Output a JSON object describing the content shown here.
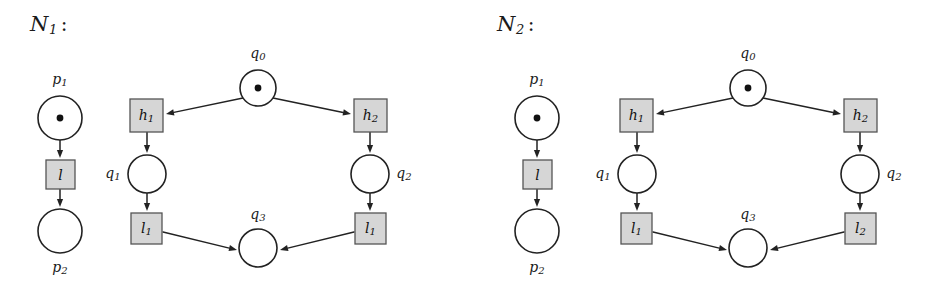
{
  "figure": {
    "background_color": "#ffffff",
    "stroke_color": "#222222",
    "transition_fill": "#d6d6d6",
    "transition_stroke": "#555555",
    "token_color": "#111111"
  },
  "nets": [
    {
      "id": "net-1",
      "title": {
        "symbol": "N",
        "subscript": "1",
        "colon": ":"
      },
      "left_chain": {
        "places": [
          {
            "name": "place-p1",
            "label": "p",
            "sublabel": "1",
            "label_pos": "above",
            "tokens": 1,
            "cx": 60,
            "cy": 118,
            "r": 22,
            "lx": 60,
            "ly": 80
          },
          {
            "name": "place-p2",
            "label": "p",
            "sublabel": "2",
            "label_pos": "below",
            "tokens": 0,
            "cx": 60,
            "cy": 231,
            "r": 22,
            "lx": 60,
            "ly": 268
          }
        ],
        "transitions": [
          {
            "name": "transition-l",
            "label": "l",
            "sublabel": "",
            "x": 46,
            "y": 160,
            "w": 29,
            "h": 29
          }
        ],
        "arcs": [
          {
            "name": "arc-p1-l",
            "x1": 60,
            "y1": 140,
            "x2": 60,
            "y2": 158
          },
          {
            "name": "arc-l-p2",
            "x1": 60,
            "y1": 189,
            "x2": 60,
            "y2": 207
          }
        ]
      },
      "main": {
        "places": [
          {
            "name": "place-q0",
            "label": "q",
            "sublabel": "0",
            "label_pos": "above",
            "tokens": 1,
            "cx": 258,
            "cy": 88,
            "r": 18,
            "lx": 258,
            "ly": 54
          },
          {
            "name": "place-q1",
            "label": "q",
            "sublabel": "1",
            "label_pos": "left",
            "tokens": 0,
            "cx": 147,
            "cy": 174,
            "r": 19,
            "lx": 113,
            "ly": 174
          },
          {
            "name": "place-q2",
            "label": "q",
            "sublabel": "2",
            "label_pos": "right",
            "tokens": 0,
            "cx": 370,
            "cy": 174,
            "r": 19,
            "lx": 404,
            "ly": 174
          },
          {
            "name": "place-q3",
            "label": "q",
            "sublabel": "3",
            "label_pos": "above",
            "tokens": 0,
            "cx": 258,
            "cy": 248,
            "r": 19,
            "lx": 258,
            "ly": 215
          }
        ],
        "transitions": [
          {
            "name": "transition-h1",
            "label": "h",
            "sublabel": "1",
            "x": 130,
            "y": 99,
            "w": 33,
            "h": 33
          },
          {
            "name": "transition-h2",
            "label": "h",
            "sublabel": "2",
            "x": 354,
            "y": 99,
            "w": 33,
            "h": 33
          },
          {
            "name": "transition-l1-left",
            "label": "l",
            "sublabel": "1",
            "x": 131,
            "y": 213,
            "w": 31,
            "h": 31
          },
          {
            "name": "transition-l1-right",
            "label": "l",
            "sublabel": "1",
            "x": 355,
            "y": 213,
            "w": 31,
            "h": 31
          }
        ],
        "arcs": [
          {
            "name": "arc-q0-h1",
            "x1": 243,
            "y1": 98,
            "x2": 166,
            "y2": 114
          },
          {
            "name": "arc-q0-h2",
            "x1": 273,
            "y1": 98,
            "x2": 351,
            "y2": 114
          },
          {
            "name": "arc-h1-q1",
            "x1": 147,
            "y1": 132,
            "x2": 147,
            "y2": 153
          },
          {
            "name": "arc-h2-q2",
            "x1": 370,
            "y1": 132,
            "x2": 370,
            "y2": 153
          },
          {
            "name": "arc-q1-l1left",
            "x1": 147,
            "y1": 193,
            "x2": 147,
            "y2": 211
          },
          {
            "name": "arc-q2-l1right",
            "x1": 370,
            "y1": 193,
            "x2": 370,
            "y2": 211
          },
          {
            "name": "arc-l1left-q3",
            "x1": 163,
            "y1": 232,
            "x2": 237,
            "y2": 250
          },
          {
            "name": "arc-l1right-q3",
            "x1": 354,
            "y1": 232,
            "x2": 280,
            "y2": 250
          }
        ]
      }
    },
    {
      "id": "net-2",
      "title": {
        "symbol": "N",
        "subscript": "2",
        "colon": ":"
      },
      "left_chain": {
        "places": [
          {
            "name": "place-p1",
            "label": "p",
            "sublabel": "1",
            "label_pos": "above",
            "tokens": 1,
            "cx": 70,
            "cy": 118,
            "r": 22,
            "lx": 70,
            "ly": 80
          },
          {
            "name": "place-p2",
            "label": "p",
            "sublabel": "2",
            "label_pos": "below",
            "tokens": 0,
            "cx": 70,
            "cy": 231,
            "r": 22,
            "lx": 70,
            "ly": 268
          }
        ],
        "transitions": [
          {
            "name": "transition-l",
            "label": "l",
            "sublabel": "",
            "x": 56,
            "y": 160,
            "w": 29,
            "h": 29
          }
        ],
        "arcs": [
          {
            "name": "arc-p1-l",
            "x1": 70,
            "y1": 140,
            "x2": 70,
            "y2": 158
          },
          {
            "name": "arc-l-p2",
            "x1": 70,
            "y1": 189,
            "x2": 70,
            "y2": 207
          }
        ]
      },
      "main": {
        "places": [
          {
            "name": "place-q0",
            "label": "q",
            "sublabel": "0",
            "label_pos": "above",
            "tokens": 1,
            "cx": 281,
            "cy": 88,
            "r": 18,
            "lx": 281,
            "ly": 54
          },
          {
            "name": "place-q1",
            "label": "q",
            "sublabel": "1",
            "label_pos": "left",
            "tokens": 0,
            "cx": 170,
            "cy": 174,
            "r": 19,
            "lx": 136,
            "ly": 174
          },
          {
            "name": "place-q2",
            "label": "q",
            "sublabel": "2",
            "label_pos": "right",
            "tokens": 0,
            "cx": 393,
            "cy": 174,
            "r": 19,
            "lx": 427,
            "ly": 174
          },
          {
            "name": "place-q3",
            "label": "q",
            "sublabel": "3",
            "label_pos": "above",
            "tokens": 0,
            "cx": 281,
            "cy": 248,
            "r": 19,
            "lx": 281,
            "ly": 215
          }
        ],
        "transitions": [
          {
            "name": "transition-h1",
            "label": "h",
            "sublabel": "1",
            "x": 153,
            "y": 99,
            "w": 33,
            "h": 33
          },
          {
            "name": "transition-h2",
            "label": "h",
            "sublabel": "2",
            "x": 377,
            "y": 99,
            "w": 33,
            "h": 33
          },
          {
            "name": "transition-l1-left",
            "label": "l",
            "sublabel": "1",
            "x": 154,
            "y": 213,
            "w": 31,
            "h": 31
          },
          {
            "name": "transition-l2-right",
            "label": "l",
            "sublabel": "2",
            "x": 378,
            "y": 213,
            "w": 31,
            "h": 31
          }
        ],
        "arcs": [
          {
            "name": "arc-q0-h1",
            "x1": 266,
            "y1": 98,
            "x2": 189,
            "y2": 114
          },
          {
            "name": "arc-q0-h2",
            "x1": 296,
            "y1": 98,
            "x2": 374,
            "y2": 114
          },
          {
            "name": "arc-h1-q1",
            "x1": 170,
            "y1": 132,
            "x2": 170,
            "y2": 153
          },
          {
            "name": "arc-h2-q2",
            "x1": 393,
            "y1": 132,
            "x2": 393,
            "y2": 153
          },
          {
            "name": "arc-q1-l1left",
            "x1": 170,
            "y1": 193,
            "x2": 170,
            "y2": 211
          },
          {
            "name": "arc-q2-l2right",
            "x1": 393,
            "y1": 193,
            "x2": 393,
            "y2": 211
          },
          {
            "name": "arc-l1left-q3",
            "x1": 186,
            "y1": 232,
            "x2": 260,
            "y2": 250
          },
          {
            "name": "arc-l2right-q3",
            "x1": 377,
            "y1": 232,
            "x2": 303,
            "y2": 250
          }
        ]
      }
    }
  ]
}
